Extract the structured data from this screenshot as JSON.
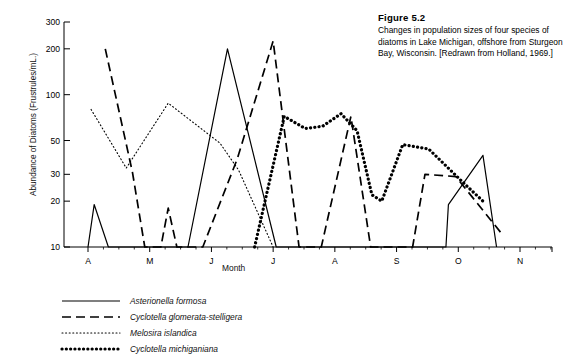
{
  "figure": {
    "label": "Figure 5.2",
    "caption": "Changes in population sizes of four species of diatoms in Lake Michigan, offshore from Sturgeon Bay, Wisconsin. [Redrawn from Holland, 1969.]"
  },
  "chart_data": {
    "type": "line",
    "title": "Figure 5.2",
    "xlabel": "Month",
    "ylabel": "Abundance of Diatoms (Frustrules/mL.)",
    "yscale": "log",
    "ylim": [
      10,
      300
    ],
    "yticks": [
      10,
      20,
      30,
      50,
      100,
      200,
      300
    ],
    "ytick_labels": [
      "10",
      "20",
      "30",
      "50",
      "100",
      "200",
      "300"
    ],
    "xtick_labels": [
      "A",
      "M",
      "J",
      "J",
      "A",
      "S",
      "O",
      "N"
    ],
    "xtick_months": [
      "April",
      "May",
      "June",
      "July",
      "August",
      "September",
      "October",
      "November"
    ],
    "xlim": [
      0,
      7
    ],
    "grid": false,
    "legend_position": "below-axes",
    "series": [
      {
        "name": "Asterionella formosa",
        "style": "solid",
        "points": [
          [
            0.0,
            10
          ],
          [
            0.1,
            19
          ],
          [
            0.33,
            10
          ],
          [
            1.62,
            10
          ],
          [
            2.26,
            200
          ],
          [
            3.05,
            10
          ],
          [
            5.8,
            10
          ],
          [
            5.84,
            19
          ],
          [
            6.4,
            40
          ],
          [
            6.62,
            10
          ]
        ]
      },
      {
        "name": "Cyclotella glomerata-stelligera",
        "style": "dashed",
        "points": [
          [
            0.28,
            200
          ],
          [
            0.72,
            31
          ],
          [
            0.92,
            10
          ],
          [
            1.18,
            10
          ],
          [
            1.3,
            18
          ],
          [
            1.44,
            10
          ],
          [
            1.86,
            10
          ],
          [
            2.42,
            38
          ],
          [
            3.0,
            225
          ],
          [
            3.42,
            10
          ],
          [
            3.78,
            10
          ],
          [
            4.26,
            72
          ],
          [
            4.58,
            10
          ],
          [
            5.26,
            10
          ],
          [
            5.46,
            30
          ],
          [
            5.96,
            29
          ],
          [
            6.72,
            12
          ]
        ]
      },
      {
        "name": "Melosira islandica",
        "style": "dotted",
        "points": [
          [
            0.05,
            80
          ],
          [
            0.62,
            33
          ],
          [
            1.3,
            88
          ],
          [
            2.14,
            48
          ],
          [
            2.44,
            32
          ],
          [
            3.0,
            10
          ]
        ]
      },
      {
        "name": "Cyclotella michiganiana",
        "style": "thick-dotted",
        "points": [
          [
            2.7,
            10
          ],
          [
            3.18,
            72
          ],
          [
            3.52,
            60
          ],
          [
            3.8,
            62
          ],
          [
            4.1,
            75
          ],
          [
            4.36,
            58
          ],
          [
            4.6,
            22
          ],
          [
            4.76,
            20
          ],
          [
            5.1,
            47
          ],
          [
            5.52,
            44
          ],
          [
            6.1,
            26
          ],
          [
            6.4,
            20
          ]
        ]
      }
    ]
  },
  "legend": {
    "items": [
      {
        "label": "Asterionella formosa",
        "style": "solid"
      },
      {
        "label": "Cyclotella glomerata-stelligera",
        "style": "dashed"
      },
      {
        "label": "Melosira islandica",
        "style": "dotted"
      },
      {
        "label": "Cyclotella michiganiana",
        "style": "thick-dotted"
      }
    ]
  },
  "colors": {
    "ink": "#000000"
  }
}
